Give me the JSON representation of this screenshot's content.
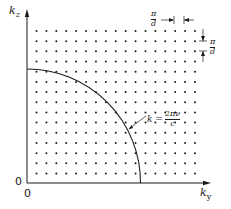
{
  "diagram": {
    "type": "k-space lattice with quarter-circle",
    "axes": {
      "vertical_label": "k_z",
      "vertical_main": "k",
      "vertical_sub": "z",
      "horizontal_label": "k_y",
      "horizontal_main": "k",
      "horizontal_sub": "y",
      "origin_vertical": "0",
      "origin_horizontal": "0"
    },
    "lattice": {
      "columns": 17,
      "rows": 15,
      "spacing_label_numerator": "π",
      "spacing_label_denominator": "d"
    },
    "curve": {
      "type": "quarter-circle",
      "label_lhs": "k =",
      "label_numerator": "2πν",
      "label_denominator": "c"
    },
    "colors": {
      "ink": "#1a1a1a",
      "background": "#ffffff"
    }
  }
}
